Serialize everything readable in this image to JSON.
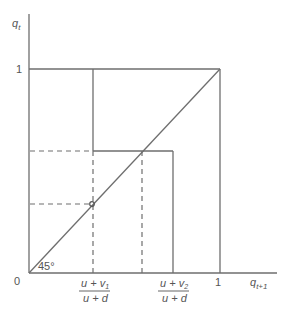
{
  "diagram": {
    "y_axis_label": "q",
    "y_axis_sub": "t",
    "x_axis_label": "q",
    "x_axis_sub": "t+1",
    "origin_label": "0",
    "y_tick_one": "1",
    "x_tick_one": "1",
    "angle_label": "45°",
    "x_tick_1_num": "u + v",
    "x_tick_1_num_sub": "1",
    "x_tick_1_den": "u + d",
    "x_tick_2_num": "u + v",
    "x_tick_2_num_sub": "2",
    "x_tick_2_den": "u + d",
    "line_color": "#6e6e6e",
    "text_color": "#555555"
  }
}
